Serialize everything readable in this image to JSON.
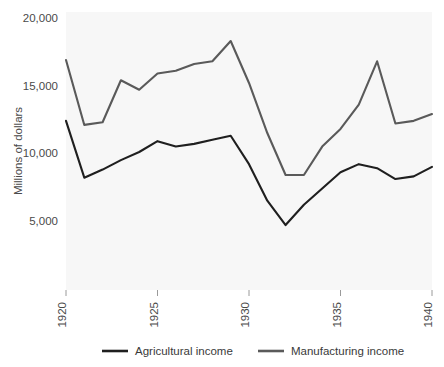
{
  "chart_data": {
    "type": "line",
    "title": "",
    "subtitle": "",
    "xlabel": "",
    "ylabel": "Millions of dollars",
    "x": [
      1920,
      1921,
      1922,
      1923,
      1924,
      1925,
      1926,
      1927,
      1928,
      1929,
      1930,
      1931,
      1932,
      1933,
      1934,
      1935,
      1936,
      1937,
      1938,
      1939,
      1940
    ],
    "xlim": [
      1920,
      1940
    ],
    "ylim": [
      3000,
      20800
    ],
    "xticks": [
      1920,
      1925,
      1930,
      1935,
      1940
    ],
    "xticklabels": [
      "1920",
      "1925",
      "1930",
      "1935",
      "1940"
    ],
    "yticks": [
      5000,
      10000,
      15000,
      20000
    ],
    "yticklabels": [
      "5,000",
      "10,000",
      "15,000",
      "20,000"
    ],
    "grid": false,
    "legend_position": "bottom",
    "series": [
      {
        "name": "Agricultural income",
        "color": "#1f1f1f",
        "values": [
          12400,
          8200,
          8800,
          9500,
          10100,
          10900,
          10500,
          10700,
          11000,
          11300,
          9200,
          6500,
          4700,
          6200,
          7400,
          8600,
          9200,
          8900,
          8100,
          8300,
          9000
        ]
      },
      {
        "name": "Manufacturing income",
        "color": "#5a5a5a",
        "values": [
          16900,
          12100,
          12300,
          15400,
          14700,
          15900,
          16100,
          16600,
          16800,
          18300,
          15200,
          11500,
          8400,
          8400,
          10500,
          11800,
          13600,
          16800,
          12200,
          12400,
          12900
        ]
      }
    ]
  },
  "legend": {
    "items": [
      {
        "label": "Agricultural income",
        "color": "#1f1f1f"
      },
      {
        "label": "Manufacturing income",
        "color": "#5a5a5a"
      }
    ]
  }
}
